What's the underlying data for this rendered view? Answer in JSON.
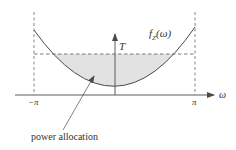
{
  "figure": {
    "type": "diagram",
    "curve_label_main": "f",
    "curve_label_sub": "Z",
    "curve_label_arg": "(ω)",
    "threshold_label": "T",
    "x_axis_label": "ω",
    "x_tick_left": "−π",
    "x_tick_right": "π",
    "annotation": "power allocation",
    "colors": {
      "line": "#4a4a4a",
      "fill": "#e2e2e2",
      "text": "#333333"
    }
  }
}
